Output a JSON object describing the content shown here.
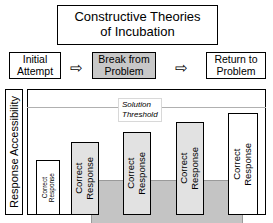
{
  "title": {
    "line1": "Constructive Theories",
    "line2": "of Incubation"
  },
  "process": {
    "steps": [
      {
        "label": "Initial\nAttempt",
        "filled": false
      },
      {
        "label": "Break from\nProblem",
        "filled": true
      },
      {
        "label": "Return to\nProblem",
        "filled": false
      }
    ],
    "arrow_glyph": "⇨"
  },
  "chart_data": {
    "type": "bar",
    "title": "Constructive Theories of Incubation",
    "ylabel": "Response Accessibility",
    "xlabel": "",
    "grid": false,
    "legend": null,
    "categories": [
      "Correct Response",
      "Correct Response",
      "Correct Response",
      "Correct Response",
      "Correct Response"
    ],
    "values": [
      55,
      73,
      83,
      93,
      102
    ],
    "ylim": [
      0,
      126
    ],
    "annotations": [
      {
        "name": "solution-threshold",
        "label_line1": "Solution",
        "label_line2": "Threshold",
        "y": 108,
        "style": "horizontal-line"
      }
    ],
    "shaded_region": {
      "label": "incubation period",
      "x_start": 1,
      "x_end": 4,
      "color": "#c4c4c4"
    }
  },
  "bars": [
    {
      "line1": "Correct",
      "line2": "Response",
      "shaded": false
    },
    {
      "line1": "Correct",
      "line2": "Response",
      "shaded": true
    },
    {
      "line1": "Correct",
      "line2": "Response",
      "shaded": true
    },
    {
      "line1": "Correct",
      "line2": "Response",
      "shaded": true
    },
    {
      "line1": "Correct",
      "line2": "Response",
      "shaded": false
    }
  ],
  "threshold": {
    "line1": "Solution",
    "line2": "Threshold"
  },
  "axis": {
    "y_label": "Response Accessibility"
  }
}
